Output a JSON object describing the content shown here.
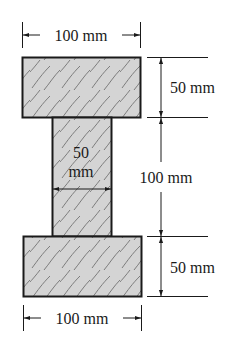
{
  "diagram": {
    "type": "cross-section",
    "colors": {
      "fill": "#d4d4d4",
      "outline": "#1a1a1a",
      "grain": "#6a6a6a",
      "dimension": "#1a1a1a"
    },
    "parts": {
      "top_flange": {
        "width": "100 mm",
        "height": "50 mm"
      },
      "web": {
        "width": "50 mm",
        "height": "100 mm"
      },
      "bottom_flange": {
        "width": "100 mm",
        "height": "50 mm"
      }
    },
    "labels": {
      "top_width": "100 mm",
      "top_height": "50 mm",
      "web_width_line1": "50",
      "web_width_line2": "mm",
      "web_height": "100 mm",
      "bottom_height": "50 mm",
      "bottom_width": "100 mm"
    }
  }
}
